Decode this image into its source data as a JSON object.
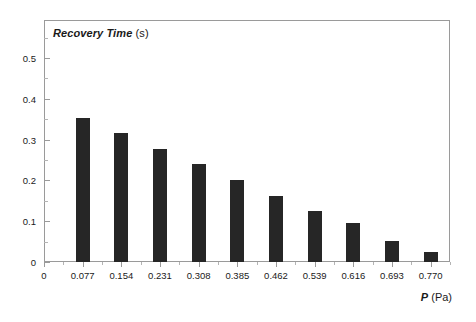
{
  "chart_data": {
    "type": "bar",
    "title": "Recovery Time (s)",
    "title_italic_part": "Recovery Time",
    "title_regular_part": " (s)",
    "xlabel": "P (Pa)",
    "xlabel_italic_part": "P",
    "xlabel_regular_part": " (Pa)",
    "ylabel": "",
    "categories": [
      "0.077",
      "0.154",
      "0.231",
      "0.308",
      "0.385",
      "0.462",
      "0.539",
      "0.616",
      "0.693",
      "0.770"
    ],
    "values": [
      0.352,
      0.316,
      0.277,
      0.24,
      0.201,
      0.162,
      0.125,
      0.096,
      0.051,
      0.025
    ],
    "x_tick_labels": [
      "0",
      "0.077",
      "0.154",
      "0.231",
      "0.308",
      "0.385",
      "0.462",
      "0.539",
      "0.616",
      "0.693",
      "0.770"
    ],
    "y_tick_labels": [
      "0",
      "0.1",
      "0.2",
      "0.3",
      "0.4",
      "0.5"
    ],
    "y_tick_values": [
      0,
      0.1,
      0.2,
      0.3,
      0.4,
      0.5
    ],
    "y_minor_tick_values": [
      0.05,
      0.15,
      0.25,
      0.35,
      0.45,
      0.55
    ],
    "ylim": [
      0,
      0.5929
    ],
    "xlim": [
      0,
      0.8085
    ],
    "grid": false,
    "legend": false,
    "bar_color": "#262626",
    "axis_color": "#9a9a9a",
    "text_color": "#1a1a1a",
    "background": "#ffffff"
  }
}
